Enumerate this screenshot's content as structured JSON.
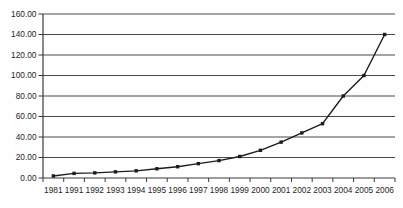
{
  "chart_data": {
    "type": "line",
    "title": "",
    "xlabel": "",
    "ylabel": "",
    "categories": [
      "1981",
      "1991",
      "1992",
      "1993",
      "1994",
      "1995",
      "1996",
      "1997",
      "1998",
      "1999",
      "2000",
      "2001",
      "2002",
      "2003",
      "2004",
      "2005",
      "2006"
    ],
    "series": [
      {
        "name": "value",
        "values": [
          2,
          4.5,
          5,
          6,
          7,
          9,
          11,
          14,
          17,
          21,
          27,
          35,
          44,
          53,
          80,
          100,
          140
        ]
      }
    ],
    "ylim": [
      0,
      160
    ],
    "ytick_interval": 20,
    "ytick_labels": [
      "0.00",
      "20.00",
      "40.00",
      "60.00",
      "80.00",
      "100.00",
      "120.00",
      "140.00",
      "160.00"
    ],
    "grid": "horizontal-only",
    "legend": "none",
    "marker": "square",
    "colors": {
      "line": "#1c1c1c",
      "marker": "#1c1c1c",
      "gridline": "#4a4a4a",
      "axis": "#3a3a3a",
      "tick_text": "#262626",
      "background": "#fefefe"
    }
  }
}
